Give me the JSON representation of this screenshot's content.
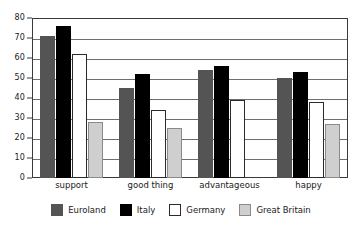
{
  "chart_data": {
    "type": "bar",
    "title": "",
    "subtitle": "",
    "xlabel": "",
    "ylabel": "",
    "categories": [
      "support",
      "good thing",
      "advantageous",
      "happy"
    ],
    "series": [
      {
        "name": "Euroland",
        "color": "#545454",
        "values": [
          71,
          45,
          54,
          50
        ]
      },
      {
        "name": "Italy",
        "color": "#000000",
        "values": [
          76,
          52,
          56,
          53
        ]
      },
      {
        "name": "Germany",
        "color": "#ffffff",
        "values": [
          62,
          34,
          39,
          38
        ]
      },
      {
        "name": "Great Britain",
        "color": "#cfcfcf",
        "values": [
          28,
          25,
          null,
          27
        ]
      }
    ],
    "ylim": [
      0,
      80
    ],
    "yticks": [
      0,
      10,
      20,
      30,
      40,
      50,
      60,
      70,
      80
    ],
    "ytick_labels": [
      "0",
      "10",
      "20",
      "30",
      "40",
      "50",
      "60",
      "70",
      "80"
    ],
    "grid": true,
    "grid_axis": "y",
    "legend_position": "bottom",
    "legend_entries": [
      "Euroland",
      "Italy",
      "Germany",
      "Great Britain"
    ],
    "annotations": []
  }
}
